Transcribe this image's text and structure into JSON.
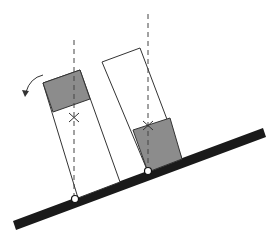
{
  "diagram": {
    "colors": {
      "background": "#ffffff",
      "line": "#333333",
      "incline": "#1a1a1a",
      "shaded": "#8c8c8c"
    },
    "left_block": {
      "state": "tips over",
      "shaded_part": "top",
      "rotation_arrow": "counterclockwise"
    },
    "right_block": {
      "state": "stable",
      "shaded_part": "bottom"
    },
    "markers": {
      "center_of_mass": "×",
      "pivot": "circle"
    }
  }
}
